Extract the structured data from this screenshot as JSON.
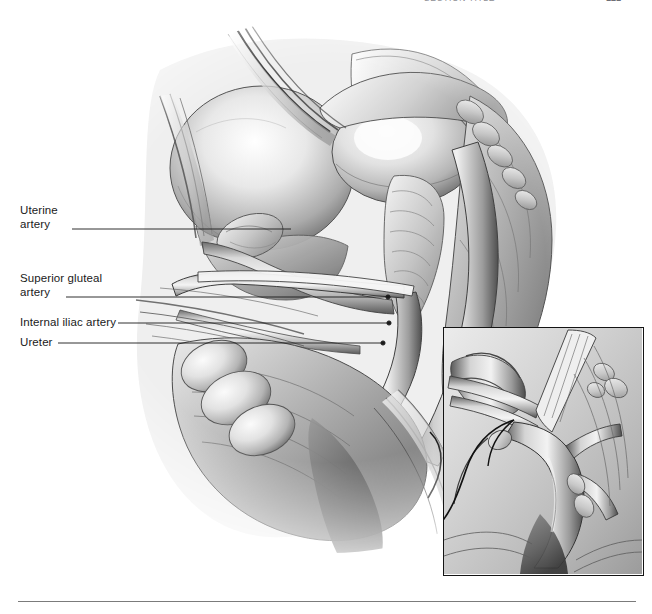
{
  "page": {
    "width": 652,
    "height": 614,
    "background_color": "#ffffff"
  },
  "header": {
    "title": "SECTION TITLE",
    "page_number": "121",
    "title_color": "#8e8e94",
    "clipped": "true"
  },
  "figure": {
    "kind": "grayscale-anatomical-illustration",
    "ink_color": "#2b2b2b",
    "tone_light": "#f2f2f2",
    "tone_mid": "#9a9a9a",
    "tone_dark": "#3a3a3a"
  },
  "callouts": [
    {
      "id": "uterine-artery",
      "label": "Uterine\nartery",
      "label_x": 20,
      "label_y": 204,
      "leader_start_x": 72,
      "leader_start_y": 229,
      "leader_end_x": 291,
      "leader_end_y": 229,
      "has_dot": false
    },
    {
      "id": "superior-gluteal-artery",
      "label": "Superior gluteal\nartery",
      "label_x": 20,
      "label_y": 272,
      "leader_start_x": 66,
      "leader_start_y": 297,
      "leader_end_x": 388,
      "leader_end_y": 297,
      "has_dot": true
    },
    {
      "id": "internal-iliac-artery",
      "label": "Internal iliac artery",
      "label_x": 20,
      "label_y": 316,
      "leader_start_x": 118,
      "leader_start_y": 323,
      "leader_end_x": 389,
      "leader_end_y": 323,
      "has_dot": true
    },
    {
      "id": "ureter",
      "label": "Ureter",
      "label_x": 20,
      "label_y": 336,
      "leader_start_x": 58,
      "leader_start_y": 343,
      "leader_end_x": 383,
      "leader_end_y": 343,
      "has_dot": true
    }
  ],
  "inset": {
    "id": "detail-inset",
    "x": 443,
    "y": 327,
    "width": 201,
    "height": 249,
    "border_color": "#141414",
    "border_width": 1.5,
    "caption": "",
    "subject": "magnified detail of iliac vessel bifurcation with suture loop"
  },
  "footer": {
    "rule_color": "#7b7b7b",
    "rule_x": 18,
    "rule_y": 601,
    "rule_width": 618
  }
}
